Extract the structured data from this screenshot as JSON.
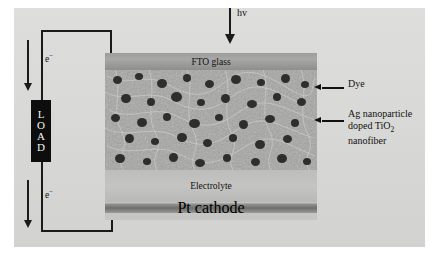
{
  "figure": {
    "background_color": "#d9d9d7"
  },
  "photon": {
    "label": "hv",
    "icon": "down-arrow-icon"
  },
  "circuit": {
    "load_label_letters": [
      "L",
      "O",
      "A",
      "D"
    ],
    "load_box_color": "#0d0d0d",
    "electron_top_label": "e",
    "electron_top_charge": "−",
    "electron_bottom_label": "e",
    "electron_bottom_charge": "−",
    "wire_color": "#1a1a1a"
  },
  "cell": {
    "layers": [
      {
        "name": "fto-glass",
        "label": "FTO glass",
        "color": "#9c9c9a"
      },
      {
        "name": "active-layer",
        "label": "",
        "color": "#9a9a98"
      },
      {
        "name": "electrolyte",
        "label": "Electrolyte",
        "color": "#bdbdbb"
      },
      {
        "name": "pt-cathode",
        "label": "Pt cathode",
        "color": "#6e6e6c"
      }
    ]
  },
  "callouts": {
    "dye": "Dye",
    "nanofiber_line1": "Ag nanoparticle",
    "nanofiber_line2_pre": "doped TiO",
    "nanofiber_line2_sub": "2",
    "nanofiber_line3": "nanofiber"
  }
}
